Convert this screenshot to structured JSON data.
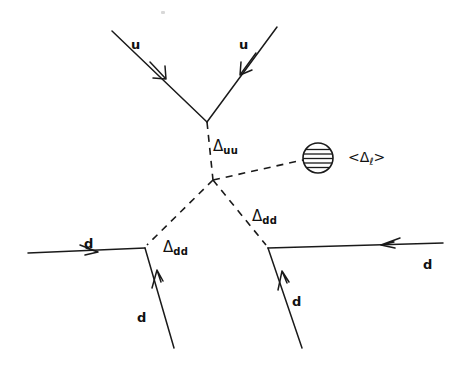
{
  "diagram": {
    "background_color": "#ffffff",
    "line_color": "#1a1a1a",
    "incoming_particles": [
      {
        "id": "u-left",
        "label": "u",
        "x": 131,
        "y": 38
      },
      {
        "id": "u-right",
        "label": "u",
        "x": 239,
        "y": 38
      },
      {
        "id": "d-left",
        "label": "d",
        "x": 84,
        "y": 237
      },
      {
        "id": "d-right",
        "label": "d",
        "x": 423,
        "y": 258
      }
    ],
    "outgoing_particles": [
      {
        "id": "d-out-left",
        "label": "d",
        "x": 137,
        "y": 311
      },
      {
        "id": "d-out-right",
        "label": "d",
        "x": 292,
        "y": 295
      }
    ],
    "propagators": [
      {
        "id": "delta-uu",
        "label": "Δ",
        "subscript": "uu",
        "x": 213,
        "y": 139,
        "style": "dashed"
      },
      {
        "id": "delta-dd-left",
        "label": "Δ",
        "subscript": "dd",
        "x": 163,
        "y": 240,
        "style": "dashed"
      },
      {
        "id": "delta-dd-right",
        "label": "Δ",
        "subscript": "dd",
        "x": 252,
        "y": 209,
        "style": "dashed"
      }
    ],
    "vev": {
      "id": "delta-L-vev",
      "open_bracket": "<",
      "label": "Δ",
      "subscript": "ℓ",
      "close_bracket": ">",
      "x": 348,
      "y": 150,
      "blob": {
        "cx": 318,
        "cy": 158,
        "r": 15,
        "hatch": "horizontal"
      }
    },
    "vertices": [
      {
        "id": "vertex-uu",
        "x": 207,
        "y": 122
      },
      {
        "id": "vertex-center",
        "x": 213,
        "y": 180
      },
      {
        "id": "vertex-dd-left",
        "x": 145,
        "y": 248
      },
      {
        "id": "vertex-dd-right",
        "x": 268,
        "y": 248
      }
    ]
  }
}
